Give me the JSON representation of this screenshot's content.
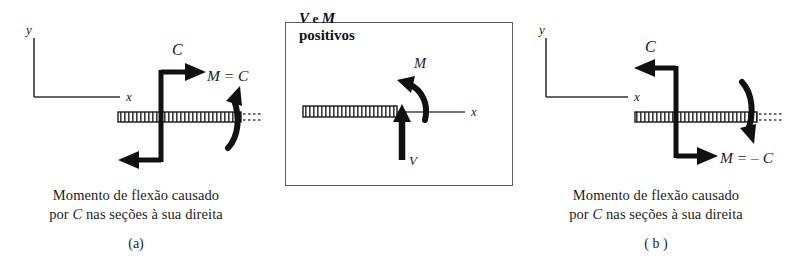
{
  "figure": {
    "type": "engineering-diagram",
    "background_color": "#ffffff",
    "ink_color": "#1a1a1a"
  },
  "panel_a": {
    "id": "panel-a",
    "axis": {
      "y_label": "y",
      "x_label": "x"
    },
    "couple_label": "C",
    "moment_label": "M = C",
    "caption_line1": "Momento de flexão causado",
    "caption_line2_prefix": "por ",
    "caption_line2_symbol": "C",
    "caption_line2_suffix": " nas seções à sua direita",
    "sublabel": "(a)",
    "couple_sense": "counterclockwise",
    "top_arrow_direction": "right",
    "bottom_arrow_direction": "left",
    "curved_arrow_direction": "up"
  },
  "panel_middle": {
    "id": "panel-middle",
    "title_v": "V",
    "title_e": "e",
    "title_m": "M",
    "title_second_line": "positivos",
    "axis_x_label": "x",
    "shear_label": "V",
    "moment_label": "M",
    "shear_arrow_direction": "up",
    "moment_arrow_sense": "counterclockwise",
    "border_color": "#5d5d5d"
  },
  "panel_b": {
    "id": "panel-b",
    "axis": {
      "y_label": "y",
      "x_label": "x"
    },
    "couple_label": "C",
    "moment_label": "M = – C",
    "caption_line1": "Momento de flexão causado",
    "caption_line2_prefix": "por ",
    "caption_line2_symbol": "C",
    "caption_line2_suffix": " nas seções à sua direita",
    "sublabel": "( b )",
    "couple_sense": "clockwise",
    "top_arrow_direction": "left",
    "bottom_arrow_direction": "right",
    "curved_arrow_direction": "down"
  }
}
